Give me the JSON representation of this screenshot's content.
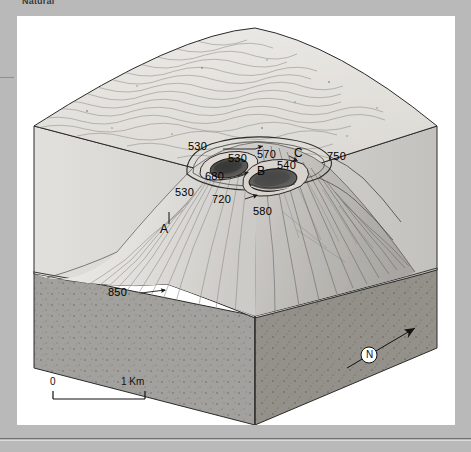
{
  "caption": {
    "cropped_text": "Natural"
  },
  "figure": {
    "title_visible": false,
    "contour_labels": [
      {
        "id": "c-530-top",
        "value": "530",
        "x": 188,
        "y": 131
      },
      {
        "id": "c-530-mid",
        "value": "530",
        "x": 228,
        "y": 143
      },
      {
        "id": "c-570",
        "value": "570",
        "x": 257,
        "y": 139
      },
      {
        "id": "c-750",
        "value": "750",
        "x": 327,
        "y": 141
      },
      {
        "id": "c-540",
        "value": "540",
        "x": 277,
        "y": 150
      },
      {
        "id": "c-680",
        "value": "680",
        "x": 205,
        "y": 161
      },
      {
        "id": "c-530-left",
        "value": "530",
        "x": 175,
        "y": 177
      },
      {
        "id": "c-720",
        "value": "720",
        "x": 212,
        "y": 184
      },
      {
        "id": "c-580",
        "value": "580",
        "x": 253,
        "y": 196
      },
      {
        "id": "c-850",
        "value": "850",
        "x": 108,
        "y": 277
      }
    ],
    "point_labels": [
      {
        "id": "pt-a",
        "value": "A",
        "x": 160,
        "y": 213
      },
      {
        "id": "pt-b",
        "value": "B",
        "x": 257,
        "y": 155
      },
      {
        "id": "pt-c",
        "value": "C",
        "x": 294,
        "y": 137
      }
    ],
    "scale_bar": {
      "left_label": "0",
      "right_label": "1 Km"
    },
    "north_arrow": {
      "label": "N"
    }
  },
  "colors": {
    "page_background": "#b9b9b9",
    "panel_background": "#ffffff",
    "block_top_face": "#e8e6e2",
    "block_left_face": "#dcdad6",
    "block_right_face": "#cfcdc9",
    "basement_left": "#9e9c98",
    "basement_right": "#8f8d89",
    "volcano_light": "#e3e1dd",
    "volcano_shadow": "#b5b3af",
    "crater_dark": "#4a4a4a",
    "outline": "#2b2b2b"
  }
}
